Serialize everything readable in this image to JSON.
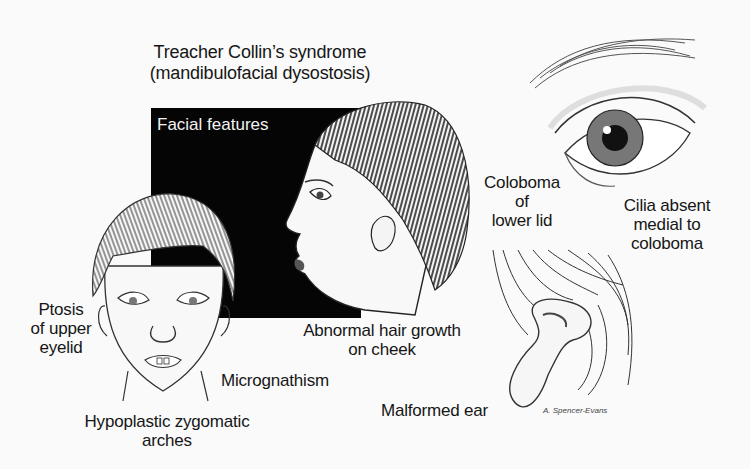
{
  "title": {
    "line1": "Treacher Collin’s syndrome",
    "line2": "(mandibulofacial dysostosis)"
  },
  "panel": {
    "label": "Facial features",
    "background": "#050505",
    "text_color": "#f2f2f2"
  },
  "illustrations": [
    {
      "name": "frontal-face",
      "description": "Front view of child's face"
    },
    {
      "name": "profile-face",
      "description": "Side profile of child's head"
    },
    {
      "name": "eye-closeup",
      "description": "Close-up of eye with lower lid coloboma"
    },
    {
      "name": "malformed-ear",
      "description": "Close-up of malformed ear"
    }
  ],
  "labels": {
    "ptosis": {
      "line1": "Ptosis",
      "line2": "of upper",
      "line3": "eyelid"
    },
    "hypoplastic": {
      "line1": "Hypoplastic zygomatic",
      "line2": "arches"
    },
    "micrognathism": "Micrognathism",
    "abnormal_hair": {
      "line1": "Abnormal hair growth",
      "line2": "on cheek"
    },
    "coloboma": {
      "line1": "Coloboma",
      "line2": "of",
      "line3": "lower lid"
    },
    "cilia": {
      "line1": "Cilia absent",
      "line2": "medial to",
      "line3": "coloboma"
    },
    "malformed_ear": "Malformed ear"
  },
  "signature": "A. Spencer-Evans"
}
